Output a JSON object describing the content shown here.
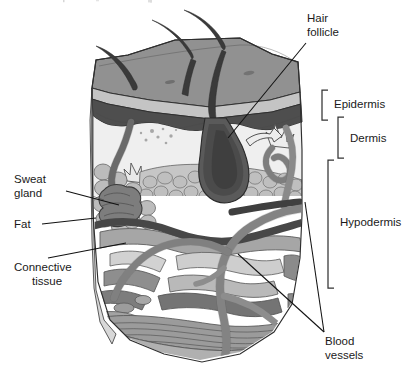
{
  "figure": {
    "title_fragment": "",
    "labels": {
      "hair_follicle": "Hair\nfollicle",
      "hair_follicle_line1": "Hair",
      "hair_follicle_line2": "follicle",
      "sweat_gland_line1": "Sweat",
      "sweat_gland_line2": "gland",
      "fat": "Fat",
      "connective_tissue_line1": "Connective",
      "connective_tissue_line2": "tissue",
      "blood_vessels_line1": "Blood",
      "blood_vessels_line2": "vessels",
      "epidermis": "Epidermis",
      "dermis": "Dermis",
      "hypodermis": "Hypodermis"
    },
    "layers": [
      {
        "name": "Epidermis",
        "bracket": "right",
        "order": 1
      },
      {
        "name": "Dermis",
        "bracket": "right",
        "order": 2
      },
      {
        "name": "Hypodermis",
        "bracket": "right",
        "order": 3
      }
    ],
    "structures": [
      {
        "name": "Hair follicle",
        "callout": "right-top"
      },
      {
        "name": "Sweat gland",
        "callout": "left"
      },
      {
        "name": "Fat",
        "callout": "left"
      },
      {
        "name": "Connective tissue",
        "callout": "left"
      },
      {
        "name": "Blood vessels",
        "callout": "right-bottom"
      }
    ],
    "colors": {
      "background": "#ffffff",
      "text": "#1a1a1a",
      "leader": "#111111",
      "bracket": "#333333",
      "surface_top": "#8f8f8f",
      "surface_top_light": "#b8b8b8",
      "epidermis_band": "#555555",
      "epidermis_band_dark": "#4a4a4a",
      "dermis_light": "#ededed",
      "dermis_mid": "#c9c9c9",
      "fat_cells": "#bdbdbd",
      "fat_outline": "#6e6e6e",
      "hair_dark": "#3c3c3c",
      "follicle_dark": "#4f4f4f",
      "sweat_gland": "#7c7c7c",
      "vessel_gray": "#949494",
      "vessel_dark": "#5a5a5a",
      "connective_mid": "#9c9c9c",
      "connective_dark": "#6f6f6f",
      "connective_light": "#d4d4d4",
      "muscle_band": "#a0a0a0"
    }
  }
}
